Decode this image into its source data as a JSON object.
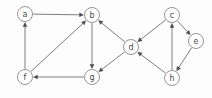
{
  "figure": {
    "background_color": "#fdfdfd",
    "node_fill": "#ffffff",
    "node_stroke": "#8a8a8a",
    "edge_color": "#6f6f6f",
    "arrow_color": "#4d4d4d",
    "label_color": "#4a4a4a",
    "width": 212,
    "height": 98
  },
  "nodes": [
    {
      "id": "a",
      "label": "a",
      "x": 25,
      "y": 14,
      "r": 7.5
    },
    {
      "id": "b",
      "label": "b",
      "x": 92,
      "y": 15,
      "r": 7.5
    },
    {
      "id": "c",
      "label": "c",
      "x": 172,
      "y": 15,
      "r": 7.5
    },
    {
      "id": "d",
      "label": "d",
      "x": 131,
      "y": 47,
      "r": 7.5
    },
    {
      "id": "e",
      "label": "e",
      "x": 196,
      "y": 41,
      "r": 7.5
    },
    {
      "id": "f",
      "label": "f",
      "x": 25,
      "y": 77,
      "r": 7.5
    },
    {
      "id": "g",
      "label": "g",
      "x": 92,
      "y": 77,
      "r": 7.5
    },
    {
      "id": "h",
      "label": "h",
      "x": 172,
      "y": 78,
      "r": 7.5
    }
  ],
  "edges": [
    {
      "id": "a-b",
      "from": "a",
      "to": "b",
      "directed": true
    },
    {
      "id": "f-a",
      "from": "f",
      "to": "a",
      "directed": true
    },
    {
      "id": "f-b",
      "from": "f",
      "to": "b",
      "directed": true
    },
    {
      "id": "b-g",
      "from": "b",
      "to": "g",
      "directed": true
    },
    {
      "id": "g-f",
      "from": "g",
      "to": "f",
      "directed": true
    },
    {
      "id": "d-b",
      "from": "d",
      "to": "b",
      "directed": true
    },
    {
      "id": "d-g",
      "from": "d",
      "to": "g",
      "directed": true
    },
    {
      "id": "c-d",
      "from": "c",
      "to": "d",
      "directed": true
    },
    {
      "id": "c-e",
      "from": "c",
      "to": "e",
      "directed": true
    },
    {
      "id": "h-d",
      "from": "h",
      "to": "d",
      "directed": true
    },
    {
      "id": "h-c",
      "from": "h",
      "to": "c",
      "directed": true
    },
    {
      "id": "e-h",
      "from": "e",
      "to": "h",
      "directed": true
    }
  ]
}
